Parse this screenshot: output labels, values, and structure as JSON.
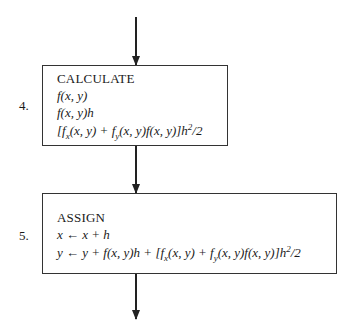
{
  "steps": [
    {
      "number": "4.",
      "title": "CALCULATE",
      "lines": [
        "f(x, y)",
        "f(x, y)h",
        "[fx(x, y) + fy(x, y)f(x, y)]h²/2"
      ]
    },
    {
      "number": "5.",
      "title": "ASSIGN",
      "lines": [
        "x ← x + h",
        "y ← y + f(x, y)h + [fx(x, y) + fy(x, y)f(x, y)]h²/2"
      ]
    }
  ]
}
